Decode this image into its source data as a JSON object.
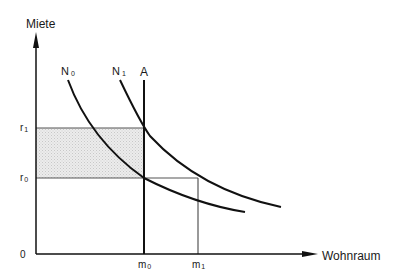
{
  "diagram": {
    "y_axis_label": "Miete",
    "x_axis_label": "Wohnraum",
    "origin_label": "0",
    "curves": [
      {
        "name": "N",
        "sub": "0"
      },
      {
        "name": "N",
        "sub": "1"
      }
    ],
    "supply_label": "A",
    "y_ticks": [
      {
        "name": "r",
        "sub": "1"
      },
      {
        "name": "r",
        "sub": "0"
      }
    ],
    "x_ticks": [
      {
        "name": "m",
        "sub": "0"
      },
      {
        "name": "m",
        "sub": "1"
      }
    ],
    "colors": {
      "line": "#111111",
      "thin_line": "#555555",
      "shade": "#e2e2e2"
    }
  }
}
